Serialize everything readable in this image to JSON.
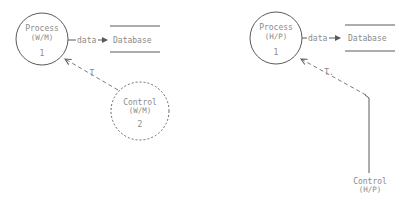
{
  "diagrams": [
    {
      "id": "left",
      "process": {
        "name": "Process",
        "type": "(W/M)",
        "number": "1"
      },
      "flow_label": "data",
      "store_label": "Database",
      "control": {
        "name": "Control",
        "type": "(W/M)",
        "number": "2",
        "style": "dashed-circle"
      },
      "control_flow_label": "T"
    },
    {
      "id": "right",
      "process": {
        "name": "Process",
        "type": "(H/P)",
        "number": "1"
      },
      "flow_label": "data",
      "store_label": "Database",
      "control": {
        "name": "Control",
        "type": "(H/P)",
        "style": "terminator-line"
      },
      "control_flow_label": "T."
    }
  ],
  "colors": {
    "stroke": "#5a5a5a",
    "text": "#8a8a8a",
    "background": "#ffffff"
  }
}
